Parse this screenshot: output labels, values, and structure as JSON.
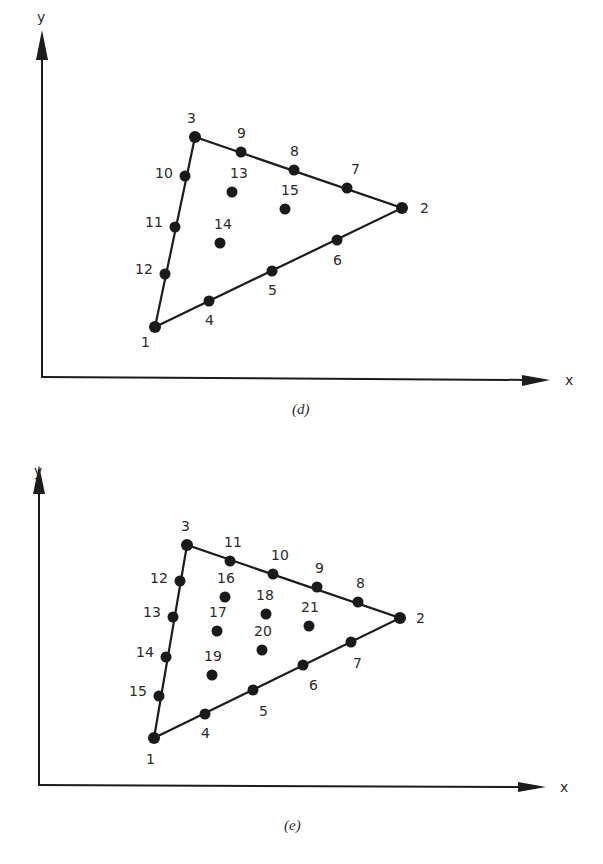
{
  "figures": [
    {
      "id": "d",
      "caption": "(d)",
      "x_axis_label": "x",
      "y_axis_label": "y",
      "element": "triangle, 15 nodes (quartic)",
      "corner_nodes": [
        "1",
        "2",
        "3"
      ],
      "nodes": [
        {
          "label": "1",
          "role": "corner"
        },
        {
          "label": "2",
          "role": "corner"
        },
        {
          "label": "3",
          "role": "corner"
        },
        {
          "label": "4",
          "role": "edge",
          "edge": "1-2"
        },
        {
          "label": "5",
          "role": "edge",
          "edge": "1-2"
        },
        {
          "label": "6",
          "role": "edge",
          "edge": "1-2"
        },
        {
          "label": "7",
          "role": "edge",
          "edge": "2-3"
        },
        {
          "label": "8",
          "role": "edge",
          "edge": "2-3"
        },
        {
          "label": "9",
          "role": "edge",
          "edge": "2-3"
        },
        {
          "label": "10",
          "role": "edge",
          "edge": "3-1"
        },
        {
          "label": "11",
          "role": "edge",
          "edge": "3-1"
        },
        {
          "label": "12",
          "role": "edge",
          "edge": "3-1"
        },
        {
          "label": "13",
          "role": "interior"
        },
        {
          "label": "14",
          "role": "interior"
        },
        {
          "label": "15",
          "role": "interior"
        }
      ]
    },
    {
      "id": "e",
      "caption": "(e)",
      "x_axis_label": "x",
      "y_axis_label": "y",
      "element": "triangle, 21 nodes (quintic)",
      "corner_nodes": [
        "1",
        "2",
        "3"
      ],
      "nodes": [
        {
          "label": "1",
          "role": "corner"
        },
        {
          "label": "2",
          "role": "corner"
        },
        {
          "label": "3",
          "role": "corner"
        },
        {
          "label": "4",
          "role": "edge",
          "edge": "1-2"
        },
        {
          "label": "5",
          "role": "edge",
          "edge": "1-2"
        },
        {
          "label": "6",
          "role": "edge",
          "edge": "1-2"
        },
        {
          "label": "7",
          "role": "edge",
          "edge": "1-2"
        },
        {
          "label": "8",
          "role": "edge",
          "edge": "2-3"
        },
        {
          "label": "9",
          "role": "edge",
          "edge": "2-3"
        },
        {
          "label": "10",
          "role": "edge",
          "edge": "2-3"
        },
        {
          "label": "11",
          "role": "edge",
          "edge": "2-3"
        },
        {
          "label": "12",
          "role": "edge",
          "edge": "3-1"
        },
        {
          "label": "13",
          "role": "edge",
          "edge": "3-1"
        },
        {
          "label": "14",
          "role": "edge",
          "edge": "3-1"
        },
        {
          "label": "15",
          "role": "edge",
          "edge": "3-1"
        },
        {
          "label": "16",
          "role": "interior"
        },
        {
          "label": "17",
          "role": "interior"
        },
        {
          "label": "18",
          "role": "interior"
        },
        {
          "label": "19",
          "role": "interior"
        },
        {
          "label": "20",
          "role": "interior"
        },
        {
          "label": "21",
          "role": "interior"
        }
      ]
    }
  ]
}
